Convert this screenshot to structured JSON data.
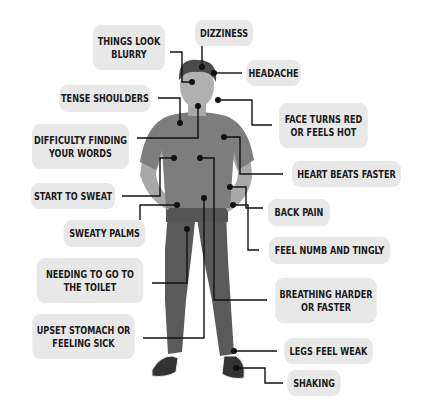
{
  "diagram": {
    "type": "annotated-figure",
    "colors": {
      "label_bg": "#e8e8e8",
      "label_text": "#1a1a1a",
      "connector": "#111111",
      "shirt": "#7d7d7d",
      "trousers": "#5a5a5a",
      "skin": "#a8a8a8",
      "hair": "#4a4a4a"
    },
    "labels": [
      {
        "id": "things-look-blurry",
        "text": "THINGS LOOK\nBLURRY"
      },
      {
        "id": "dizziness",
        "text": "DIZZINESS"
      },
      {
        "id": "headache",
        "text": "HEADACHE"
      },
      {
        "id": "tense-shoulders",
        "text": "TENSE SHOULDERS"
      },
      {
        "id": "face-turns-red",
        "text": "FACE TURNS RED\nOR FEELS HOT"
      },
      {
        "id": "difficulty-finding-words",
        "text": "DIFFICULTY FINDING\nYOUR WORDS"
      },
      {
        "id": "heart-beats-faster",
        "text": "HEART BEATS FASTER"
      },
      {
        "id": "start-to-sweat",
        "text": "START TO SWEAT"
      },
      {
        "id": "back-pain",
        "text": "BACK PAIN"
      },
      {
        "id": "sweaty-palms",
        "text": "SWEATY PALMS"
      },
      {
        "id": "feel-numb-tingly",
        "text": "FEEL NUMB AND TINGLY"
      },
      {
        "id": "needing-toilet",
        "text": "NEEDING TO GO TO\nTHE TOILET"
      },
      {
        "id": "breathing-harder",
        "text": "BREATHING HARDER\nOR FASTER"
      },
      {
        "id": "upset-stomach",
        "text": "UPSET STOMACH OR\nFEELING SICK"
      },
      {
        "id": "legs-feel-weak",
        "text": "LEGS FEEL WEAK"
      },
      {
        "id": "shaking",
        "text": "SHAKING"
      }
    ]
  }
}
